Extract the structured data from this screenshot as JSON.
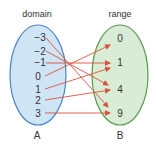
{
  "domain_set": {
    "title": "domain",
    "name": "A",
    "values": [
      "−3",
      "−2",
      "−1",
      "0",
      "1",
      "2",
      "3"
    ],
    "fill": "#cfe4f4",
    "stroke": "#4a86c5"
  },
  "range_set": {
    "title": "range",
    "name": "B",
    "values": [
      "0",
      "1",
      "4",
      "9"
    ],
    "fill": "#d9ecd6",
    "stroke": "#5a9a4e"
  },
  "arrow_color": "#d9533e",
  "mappings": [
    {
      "from": "−3",
      "to": "9"
    },
    {
      "from": "−2",
      "to": "4"
    },
    {
      "from": "−1",
      "to": "1"
    },
    {
      "from": "0",
      "to": "0"
    },
    {
      "from": "1",
      "to": "1"
    },
    {
      "from": "2",
      "to": "4"
    },
    {
      "from": "3",
      "to": "9"
    }
  ]
}
